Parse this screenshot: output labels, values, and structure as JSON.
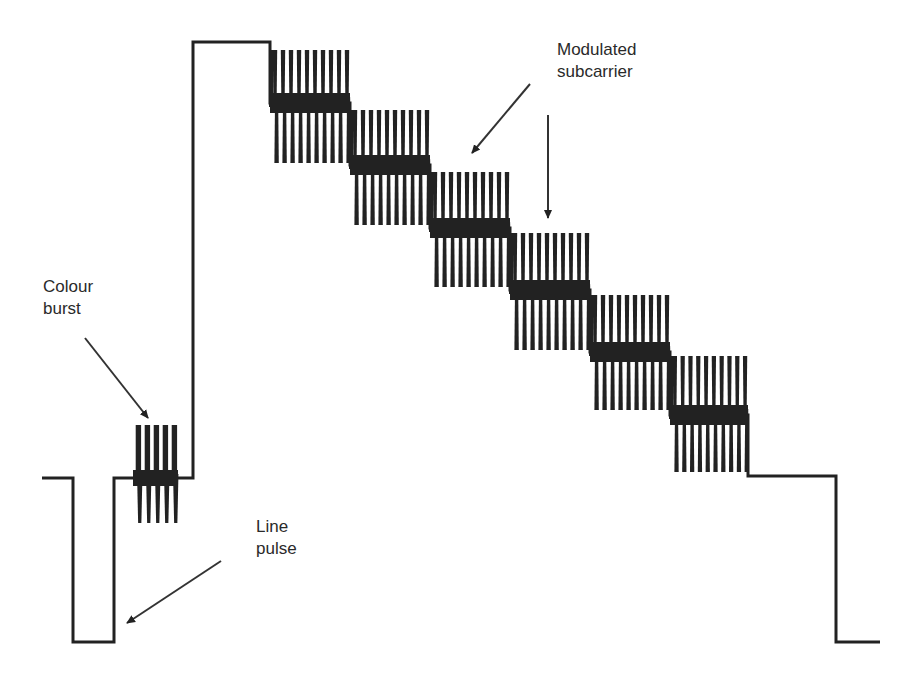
{
  "diagram": {
    "type": "waveform",
    "stroke_color": "#222222",
    "background": "#ffffff",
    "labels": [
      {
        "id": "modulated-subcarrier",
        "lines": [
          "Modulated",
          "subcarrier"
        ],
        "x": 557,
        "y": 39
      },
      {
        "id": "colour-burst",
        "lines": [
          "Colour",
          "burst"
        ],
        "x": 43,
        "y": 276
      },
      {
        "id": "line-pulse",
        "lines": [
          "Line",
          "pulse"
        ],
        "x": 256,
        "y": 516
      }
    ],
    "levels": {
      "blanking_y": 478,
      "sync_tip_y": 642,
      "white_y": 42
    },
    "segments": {
      "front_porch": {
        "x0": 42,
        "x1": 73
      },
      "sync_pulse": {
        "x0": 73,
        "x1": 114
      },
      "burst": {
        "x0": 133,
        "x1": 178,
        "top": 425,
        "bottom": 523,
        "cycles": 5
      },
      "back_porch_end": 193,
      "white_bar": {
        "x0": 193,
        "x1": 270
      },
      "steps": [
        {
          "x0": 270,
          "x1": 350,
          "center": 103,
          "top": 50,
          "bottom": 163
        },
        {
          "x0": 350,
          "x1": 430,
          "center": 165,
          "top": 110,
          "bottom": 225
        },
        {
          "x0": 430,
          "x1": 510,
          "center": 228,
          "top": 172,
          "bottom": 287
        },
        {
          "x0": 510,
          "x1": 590,
          "center": 290,
          "top": 233,
          "bottom": 350
        },
        {
          "x0": 590,
          "x1": 670,
          "center": 352,
          "top": 295,
          "bottom": 410
        },
        {
          "x0": 670,
          "x1": 748,
          "center": 415,
          "top": 356,
          "bottom": 472
        }
      ],
      "step_cycles": 10,
      "trailing_blanking": {
        "x0": 748,
        "x1": 836
      },
      "trailing_sync": {
        "x0": 836,
        "x1": 880
      }
    },
    "arrows": [
      {
        "id": "subcarrier-arrow-diagonal",
        "x1": 530,
        "y1": 84,
        "x2": 472,
        "y2": 153
      },
      {
        "id": "subcarrier-arrow-vertical",
        "x1": 548,
        "y1": 115,
        "x2": 548,
        "y2": 218
      },
      {
        "id": "colour-burst-arrow",
        "x1": 85,
        "y1": 338,
        "x2": 148,
        "y2": 418
      },
      {
        "id": "line-pulse-arrow",
        "x1": 221,
        "y1": 561,
        "x2": 127,
        "y2": 623
      }
    ]
  }
}
